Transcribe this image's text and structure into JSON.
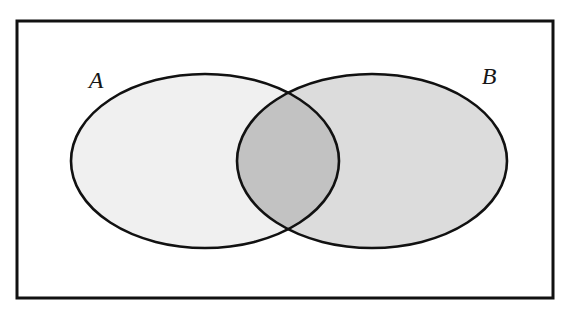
{
  "figure": {
    "name": "venn-diagram-two-sets",
    "type": "venn",
    "width": 584,
    "height": 313,
    "background_color": "#ffffff"
  },
  "universe": {
    "shape": "rectangle",
    "label": "",
    "x": 17,
    "y": 21,
    "width": 536,
    "height": 277,
    "fill_color": "#ffffff",
    "stroke_color": "#111111",
    "stroke_width": 3
  },
  "sets": [
    {
      "id": "A",
      "label": "A",
      "label_x": 96,
      "label_y": 88,
      "cx": 205,
      "cy": 161,
      "rx": 134,
      "ry": 87,
      "fill_color": "#f0f0f0",
      "stroke_color": "#111111",
      "stroke_width": 2.6
    },
    {
      "id": "B",
      "label": "B",
      "label_x": 489,
      "label_y": 84,
      "cx": 372,
      "cy": 161,
      "rx": 135,
      "ry": 87,
      "fill_color": "#dcdcdc",
      "stroke_color": "#111111",
      "stroke_width": 2.6
    }
  ],
  "intersection": {
    "id": "A-and-B",
    "label": "",
    "fill_color": "#c2c2c2",
    "top_crossing": {
      "x": 288,
      "y": 92
    },
    "bottom_crossing": {
      "x": 287,
      "y": 230
    },
    "left_extent": 237,
    "right_extent": 340
  }
}
